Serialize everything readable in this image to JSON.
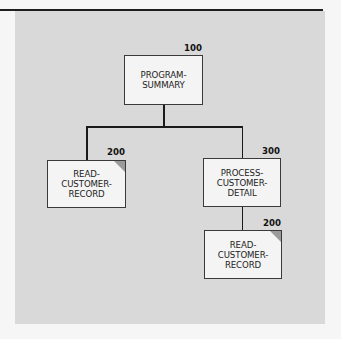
{
  "diagram": {
    "type": "structure-chart",
    "colors": {
      "panel": "#d9d9d9",
      "box_fill": "#f4f4f4",
      "box_border": "#3a3a3a",
      "connector": "#1a1a1a",
      "corner_shade": "#9a9a9a"
    },
    "nodes": [
      {
        "id": "n100",
        "number": "100",
        "label": "PROGRAM-\nSUMMARY",
        "shaded_corner": false
      },
      {
        "id": "n200a",
        "number": "200",
        "label": "READ-\nCUSTOMER-\nRECORD",
        "shaded_corner": true
      },
      {
        "id": "n300",
        "number": "300",
        "label": "PROCESS-\nCUSTOMER-\nDETAIL",
        "shaded_corner": false
      },
      {
        "id": "n200b",
        "number": "200",
        "label": "READ-\nCUSTOMER-\nRECORD",
        "shaded_corner": true
      }
    ],
    "edges": [
      {
        "from": "n100",
        "to": "n200a"
      },
      {
        "from": "n100",
        "to": "n300"
      },
      {
        "from": "n300",
        "to": "n200b"
      }
    ]
  }
}
